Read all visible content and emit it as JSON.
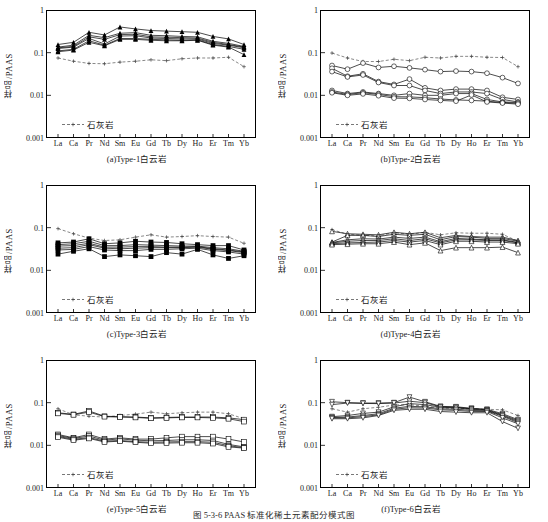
{
  "figure": {
    "caption": "图 5-3-6  PAAS 标准化稀土元素配分模式图",
    "ylabel": "样品/PAAS",
    "legend_label": "石灰岩",
    "yticks": [
      "1",
      "0.1",
      "0.01",
      "0.001"
    ],
    "ylim": [
      0.001,
      1
    ],
    "elements": [
      "La",
      "Ca",
      "Pr",
      "Nd",
      "Sm",
      "Eu",
      "Gd",
      "Tb",
      "Dy",
      "Ho",
      "Er",
      "Tm",
      "Yb"
    ]
  },
  "chart_data": [
    {
      "type": "line",
      "panel": "a",
      "title": "(a)Type-1白云岩",
      "xlabel": "",
      "ylabel": "样品/PAAS",
      "ylim": [
        0.001,
        1
      ],
      "x": [
        "La",
        "Ca",
        "Pr",
        "Nd",
        "Sm",
        "Eu",
        "Gd",
        "Tb",
        "Dy",
        "Ho",
        "Er",
        "Tm",
        "Yb"
      ],
      "marker": "filled-triangle",
      "series": [
        {
          "name": "dolomite-1",
          "values": [
            0.155,
            0.175,
            0.3,
            0.26,
            0.4,
            0.36,
            0.33,
            0.32,
            0.31,
            0.3,
            0.24,
            0.21,
            0.155
          ]
        },
        {
          "name": "dolomite-2",
          "values": [
            0.135,
            0.15,
            0.255,
            0.225,
            0.285,
            0.295,
            0.255,
            0.25,
            0.24,
            0.235,
            0.185,
            0.165,
            0.14
          ]
        },
        {
          "name": "dolomite-3",
          "values": [
            0.13,
            0.14,
            0.235,
            0.205,
            0.265,
            0.27,
            0.235,
            0.23,
            0.225,
            0.22,
            0.175,
            0.155,
            0.135
          ]
        },
        {
          "name": "dolomite-4",
          "values": [
            0.125,
            0.135,
            0.215,
            0.16,
            0.245,
            0.25,
            0.22,
            0.215,
            0.21,
            0.21,
            0.165,
            0.15,
            0.13
          ]
        },
        {
          "name": "dolomite-5",
          "values": [
            0.11,
            0.12,
            0.19,
            0.15,
            0.215,
            0.215,
            0.205,
            0.2,
            0.195,
            0.2,
            0.155,
            0.14,
            0.12
          ]
        },
        {
          "name": "dolomite-6",
          "values": [
            0.105,
            0.115,
            0.175,
            0.145,
            0.205,
            0.205,
            0.195,
            0.19,
            0.19,
            0.195,
            0.15,
            0.135,
            0.09
          ]
        }
      ],
      "reference": {
        "name": "石灰岩",
        "style": "dashed",
        "marker": "plus",
        "values": [
          0.075,
          0.063,
          0.056,
          0.055,
          0.06,
          0.063,
          0.068,
          0.065,
          0.072,
          0.075,
          0.075,
          0.078,
          0.047
        ]
      }
    },
    {
      "type": "line",
      "panel": "b",
      "title": "(b)Type-2白云岩",
      "xlabel": "",
      "ylabel": "样品/PAAS",
      "ylim": [
        0.001,
        1
      ],
      "x": [
        "La",
        "Ca",
        "Pr",
        "Nd",
        "Sm",
        "Eu",
        "Gd",
        "Tb",
        "Dy",
        "Ho",
        "Er",
        "Tm",
        "Yb"
      ],
      "marker": "open-circle",
      "series": [
        {
          "name": "dolomite-1",
          "values": [
            0.05,
            0.041,
            0.057,
            0.045,
            0.048,
            0.044,
            0.04,
            0.036,
            0.037,
            0.036,
            0.033,
            0.026,
            0.019
          ]
        },
        {
          "name": "dolomite-2",
          "values": [
            0.043,
            0.028,
            0.032,
            0.021,
            0.018,
            0.024,
            0.015,
            0.013,
            0.014,
            0.014,
            0.013,
            0.009,
            0.008
          ]
        },
        {
          "name": "dolomite-3",
          "values": [
            0.036,
            0.027,
            0.03,
            0.02,
            0.017,
            0.017,
            0.013,
            0.011,
            0.012,
            0.012,
            0.011,
            0.008,
            0.007
          ]
        },
        {
          "name": "dolomite-4",
          "values": [
            0.013,
            0.011,
            0.012,
            0.011,
            0.01,
            0.011,
            0.01,
            0.01,
            0.011,
            0.011,
            0.008,
            0.007,
            0.0068
          ]
        },
        {
          "name": "dolomite-5",
          "values": [
            0.012,
            0.0105,
            0.0115,
            0.0105,
            0.0093,
            0.0092,
            0.0088,
            0.0082,
            0.0078,
            0.0076,
            0.0073,
            0.0068,
            0.0065
          ]
        },
        {
          "name": "dolomite-6",
          "values": [
            0.0115,
            0.01,
            0.0108,
            0.0098,
            0.0086,
            0.0085,
            0.008,
            0.0076,
            0.0073,
            0.0102,
            0.007,
            0.0066,
            0.0062
          ]
        }
      ],
      "reference": {
        "name": "石灰岩",
        "style": "dashed",
        "marker": "plus",
        "values": [
          0.098,
          0.075,
          0.062,
          0.062,
          0.07,
          0.065,
          0.078,
          0.075,
          0.082,
          0.082,
          0.078,
          0.077,
          0.047
        ]
      }
    },
    {
      "type": "line",
      "panel": "c",
      "title": "(c)Type-3白云岩",
      "xlabel": "",
      "ylabel": "样品/PAAS",
      "ylim": [
        0.001,
        1
      ],
      "x": [
        "La",
        "Ca",
        "Pr",
        "Nd",
        "Sm",
        "Eu",
        "Gd",
        "Tb",
        "Dy",
        "Ho",
        "Er",
        "Tm",
        "Yb"
      ],
      "marker": "filled-square",
      "series": [
        {
          "name": "dolomite-1",
          "values": [
            0.044,
            0.046,
            0.055,
            0.042,
            0.044,
            0.048,
            0.046,
            0.045,
            0.042,
            0.04,
            0.038,
            0.038,
            0.03
          ]
        },
        {
          "name": "dolomite-2",
          "values": [
            0.04,
            0.042,
            0.048,
            0.038,
            0.038,
            0.04,
            0.039,
            0.038,
            0.037,
            0.037,
            0.034,
            0.032,
            0.028
          ]
        },
        {
          "name": "dolomite-3",
          "values": [
            0.037,
            0.038,
            0.043,
            0.035,
            0.035,
            0.036,
            0.036,
            0.035,
            0.035,
            0.036,
            0.032,
            0.03,
            0.027
          ]
        },
        {
          "name": "dolomite-4",
          "values": [
            0.033,
            0.034,
            0.04,
            0.033,
            0.032,
            0.033,
            0.034,
            0.034,
            0.034,
            0.035,
            0.031,
            0.029,
            0.026
          ]
        },
        {
          "name": "dolomite-5",
          "values": [
            0.03,
            0.031,
            0.036,
            0.03,
            0.029,
            0.029,
            0.031,
            0.031,
            0.032,
            0.033,
            0.029,
            0.027,
            0.024
          ]
        },
        {
          "name": "dolomite-6",
          "values": [
            0.024,
            0.028,
            0.032,
            0.021,
            0.023,
            0.022,
            0.021,
            0.026,
            0.024,
            0.031,
            0.023,
            0.019,
            0.022
          ]
        }
      ],
      "reference": {
        "name": "石灰岩",
        "style": "dashed",
        "marker": "plus",
        "values": [
          0.095,
          0.072,
          0.057,
          0.05,
          0.052,
          0.06,
          0.068,
          0.06,
          0.062,
          0.065,
          0.062,
          0.06,
          0.043
        ]
      }
    },
    {
      "type": "line",
      "panel": "d",
      "title": "(d)Type-4白云岩",
      "xlabel": "",
      "ylabel": "样品/PAAS",
      "ylim": [
        0.001,
        1
      ],
      "x": [
        "La",
        "Ca",
        "Pr",
        "Nd",
        "Sm",
        "Eu",
        "Gd",
        "Tb",
        "Dy",
        "Ho",
        "Er",
        "Tm",
        "Yb"
      ],
      "marker": "open-triangle",
      "series": [
        {
          "name": "dolomite-1",
          "values": [
            0.082,
            0.072,
            0.07,
            0.068,
            0.078,
            0.072,
            0.078,
            0.058,
            0.066,
            0.062,
            0.06,
            0.06,
            0.05
          ]
        },
        {
          "name": "dolomite-2",
          "values": [
            0.046,
            0.066,
            0.066,
            0.062,
            0.07,
            0.066,
            0.07,
            0.052,
            0.062,
            0.06,
            0.056,
            0.056,
            0.048
          ]
        },
        {
          "name": "dolomite-3",
          "values": [
            0.045,
            0.052,
            0.055,
            0.054,
            0.06,
            0.056,
            0.06,
            0.047,
            0.056,
            0.054,
            0.052,
            0.052,
            0.045
          ]
        },
        {
          "name": "dolomite-4",
          "values": [
            0.044,
            0.048,
            0.05,
            0.05,
            0.055,
            0.05,
            0.055,
            0.044,
            0.052,
            0.052,
            0.05,
            0.05,
            0.044
          ]
        },
        {
          "name": "dolomite-5",
          "values": [
            0.042,
            0.044,
            0.045,
            0.046,
            0.05,
            0.046,
            0.05,
            0.04,
            0.048,
            0.048,
            0.046,
            0.046,
            0.042
          ]
        },
        {
          "name": "dolomite-6",
          "values": [
            0.04,
            0.041,
            0.042,
            0.042,
            0.046,
            0.04,
            0.044,
            0.029,
            0.034,
            0.034,
            0.034,
            0.035,
            0.026
          ]
        }
      ],
      "reference": {
        "name": "石灰岩",
        "style": "dashed",
        "marker": "plus",
        "values": [
          0.09,
          0.07,
          0.066,
          0.064,
          0.076,
          0.07,
          0.078,
          0.068,
          0.076,
          0.074,
          0.074,
          0.07,
          0.048
        ]
      }
    },
    {
      "type": "line",
      "panel": "e",
      "title": "(e)Type-5白云岩",
      "xlabel": "",
      "ylabel": "样品/PAAS",
      "ylim": [
        0.001,
        1
      ],
      "x": [
        "La",
        "Ca",
        "Pr",
        "Nd",
        "Sm",
        "Eu",
        "Gd",
        "Tb",
        "Dy",
        "Ho",
        "Er",
        "Tm",
        "Yb"
      ],
      "marker": "open-square",
      "series": [
        {
          "name": "dolomite-1",
          "values": [
            0.058,
            0.053,
            0.064,
            0.048,
            0.047,
            0.046,
            0.044,
            0.045,
            0.046,
            0.046,
            0.046,
            0.044,
            0.04
          ]
        },
        {
          "name": "dolomite-2",
          "values": [
            0.056,
            0.052,
            0.06,
            0.047,
            0.046,
            0.045,
            0.043,
            0.044,
            0.045,
            0.045,
            0.044,
            0.042,
            0.036
          ]
        },
        {
          "name": "dolomite-3",
          "values": [
            0.018,
            0.015,
            0.018,
            0.014,
            0.015,
            0.014,
            0.014,
            0.015,
            0.016,
            0.016,
            0.016,
            0.014,
            0.012
          ]
        },
        {
          "name": "dolomite-4",
          "values": [
            0.017,
            0.0145,
            0.0165,
            0.0132,
            0.0142,
            0.0132,
            0.0128,
            0.013,
            0.0135,
            0.0135,
            0.013,
            0.0105,
            0.0092
          ]
        },
        {
          "name": "dolomite-5",
          "values": [
            0.0162,
            0.0138,
            0.0152,
            0.0125,
            0.013,
            0.0122,
            0.0118,
            0.012,
            0.0122,
            0.0122,
            0.0118,
            0.0098,
            0.0088
          ]
        },
        {
          "name": "dolomite-6",
          "values": [
            0.0155,
            0.0132,
            0.0145,
            0.012,
            0.0125,
            0.0118,
            0.0112,
            0.0113,
            0.0115,
            0.0115,
            0.011,
            0.0092,
            0.0086
          ]
        }
      ],
      "reference": {
        "name": "石灰岩",
        "style": "dashed",
        "marker": "plus",
        "values": [
          0.072,
          0.052,
          0.048,
          0.046,
          0.05,
          0.054,
          0.06,
          0.055,
          0.058,
          0.06,
          0.06,
          0.055,
          0.042
        ]
      }
    },
    {
      "type": "line",
      "panel": "f",
      "title": "(f)Type-6白云岩",
      "xlabel": "",
      "ylabel": "样品/PAAS",
      "ylim": [
        0.001,
        1
      ],
      "x": [
        "La",
        "Ca",
        "Pr",
        "Nd",
        "Sm",
        "Eu",
        "Gd",
        "Tb",
        "Dy",
        "Ho",
        "Er",
        "Tm",
        "Yb"
      ],
      "marker": "inverted-triangle",
      "series": [
        {
          "name": "dolomite-1",
          "values": [
            0.105,
            0.1,
            0.098,
            0.098,
            0.1,
            0.135,
            0.105,
            0.082,
            0.08,
            0.074,
            0.07,
            0.055,
            0.04
          ]
        },
        {
          "name": "dolomite-2",
          "values": [
            0.09,
            0.098,
            0.096,
            0.095,
            0.098,
            0.108,
            0.1,
            0.08,
            0.078,
            0.072,
            0.068,
            0.052,
            0.038
          ]
        },
        {
          "name": "dolomite-3",
          "values": [
            0.047,
            0.05,
            0.056,
            0.06,
            0.08,
            0.095,
            0.09,
            0.078,
            0.076,
            0.07,
            0.066,
            0.05,
            0.036
          ]
        },
        {
          "name": "dolomite-4",
          "values": [
            0.045,
            0.046,
            0.05,
            0.055,
            0.074,
            0.082,
            0.08,
            0.072,
            0.07,
            0.066,
            0.064,
            0.048,
            0.034
          ]
        },
        {
          "name": "dolomite-5",
          "values": [
            0.044,
            0.044,
            0.047,
            0.052,
            0.07,
            0.076,
            0.075,
            0.068,
            0.066,
            0.062,
            0.062,
            0.044,
            0.032
          ]
        },
        {
          "name": "dolomite-6",
          "values": [
            0.042,
            0.042,
            0.044,
            0.05,
            0.066,
            0.07,
            0.07,
            0.062,
            0.06,
            0.058,
            0.058,
            0.036,
            0.025
          ]
        }
      ],
      "reference": {
        "name": "石灰岩",
        "style": "dashed",
        "marker": "plus",
        "values": [
          0.072,
          0.06,
          0.072,
          0.078,
          0.088,
          0.09,
          0.082,
          0.076,
          0.072,
          0.072,
          0.07,
          0.068,
          0.05
        ]
      }
    }
  ]
}
